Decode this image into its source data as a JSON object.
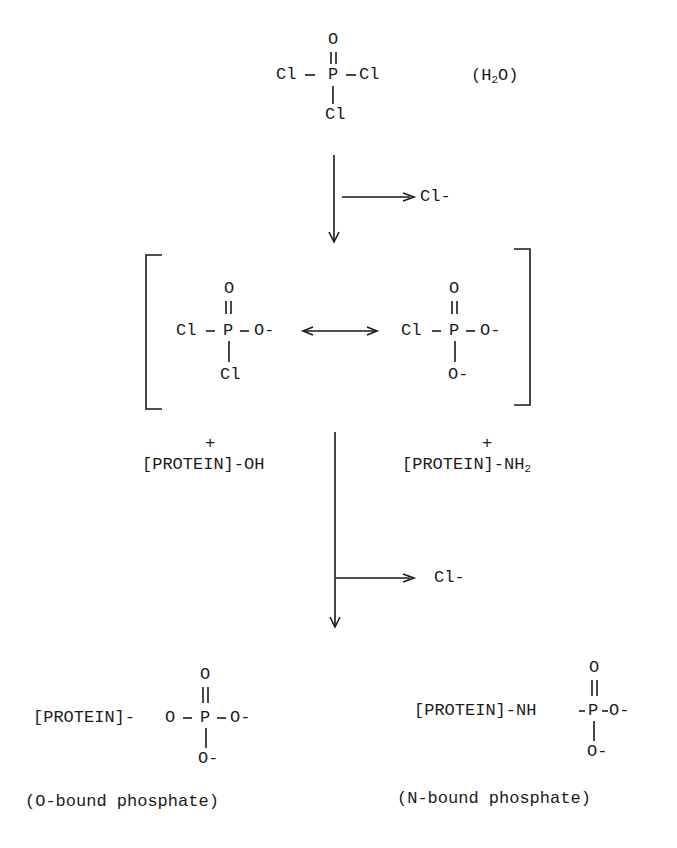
{
  "reactant": {
    "top_O": "O",
    "left_Cl": "Cl",
    "P": "P",
    "right_Cl": "Cl",
    "bottom_Cl": "Cl",
    "water": {
      "open": "(H",
      "sub": "2",
      "close": "O)"
    }
  },
  "step1": {
    "byproduct": "Cl-"
  },
  "intermediate": {
    "left": {
      "top_O": "O",
      "Cl": "Cl",
      "P": "P",
      "O_minus": "O-",
      "bottom_Cl": "Cl"
    },
    "right": {
      "top_O": "O",
      "Cl": "Cl",
      "P": "P",
      "O_minus": "O-",
      "bottom_O_minus": "O-"
    }
  },
  "reagents": {
    "left_plus": "+",
    "left": "[PROTEIN]-OH",
    "right_plus": "+",
    "right_main": "[PROTEIN]-NH",
    "right_sub": "2"
  },
  "step2": {
    "byproduct": "Cl-"
  },
  "products": {
    "o_bound": {
      "prefix": "[PROTEIN]-",
      "O": "O",
      "P": "P",
      "O_minus": "O-",
      "top_O": "O",
      "bottom_O_minus": "O-",
      "caption": "(O-bound phosphate)"
    },
    "n_bound": {
      "prefix": "[PROTEIN]-NH",
      "P": "P",
      "O_minus": "O-",
      "top_O": "O",
      "bottom_O_minus": "O-",
      "caption": "(N-bound phosphate)"
    }
  }
}
